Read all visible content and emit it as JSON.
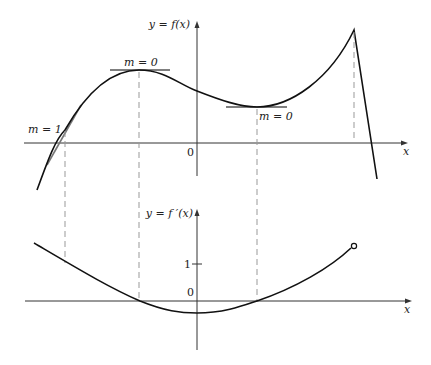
{
  "figure": {
    "top_graph": {
      "y_axis_label": "y = f(x)",
      "x_axis_label": "x",
      "origin_label": "0",
      "annotations": [
        {
          "id": "slope-one",
          "text": "m = 1"
        },
        {
          "id": "slope-zero-max",
          "text": "m = 0"
        },
        {
          "id": "slope-zero-min",
          "text": "m = 0"
        }
      ]
    },
    "bottom_graph": {
      "y_axis_label": "y = f ′(x)",
      "x_axis_label": "x",
      "origin_label": "0",
      "tick_label_one": "1"
    },
    "colors": {
      "curve": "#111111",
      "axis": "#333333",
      "tangent": "#777777",
      "dashed": "#999999"
    }
  }
}
